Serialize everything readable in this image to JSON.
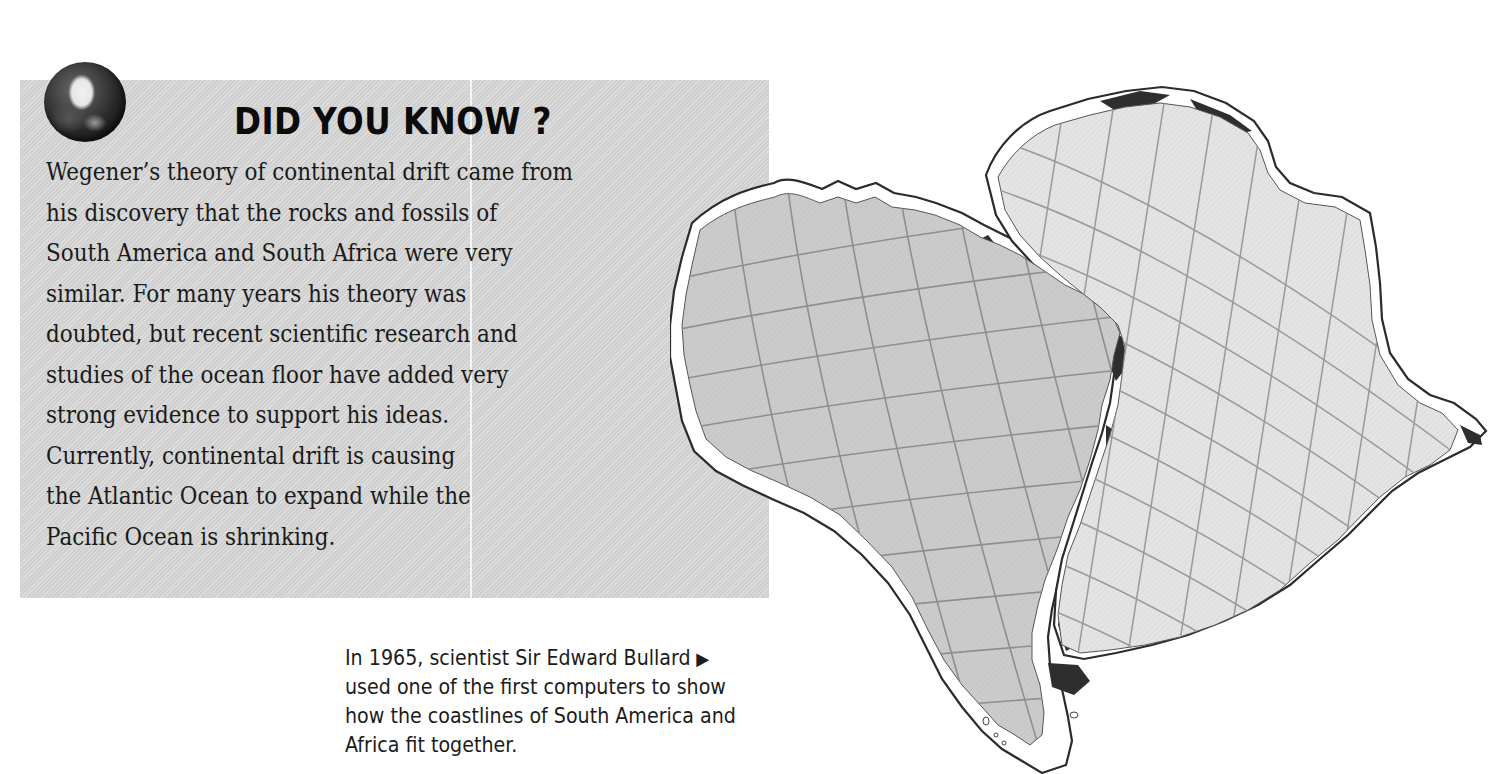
{
  "fact_box": {
    "icon": "globe-icon",
    "title": "DID YOU KNOW ?",
    "body_lines": [
      "Wegener’s theory of continental drift came from",
      "his discovery that the rocks and fossils of",
      "South America and South Africa were very",
      "similar. For many years his theory was",
      "doubted, but recent scientific research and",
      "studies of the ocean floor have added very",
      "strong evidence to support his ideas.",
      "Currently, continental drift is causing",
      "the Atlantic Ocean to expand while the",
      "Pacific Ocean is shrinking."
    ]
  },
  "caption": {
    "lines": [
      "In 1965, scientist Sir Edward Bullard",
      "used one of the first computers to show",
      "how the coastlines of South America and",
      "Africa fit together."
    ],
    "pointer_icon": "▶"
  },
  "map": {
    "subject": "Bullard fit of South America and Africa",
    "landmasses": [
      "South America",
      "Africa"
    ],
    "colors": {
      "south_america_fill": "#c9c9c9",
      "africa_fill": "#e3e3e3",
      "grid": "#8e8e8e",
      "coastline": "#2b2b2b",
      "overlap": "#2e2e2e",
      "shelf": "#ffffff"
    }
  },
  "colors": {
    "box_background": "#d6d6d6",
    "text": "#1a1a1a",
    "page_background": "#ffffff"
  }
}
